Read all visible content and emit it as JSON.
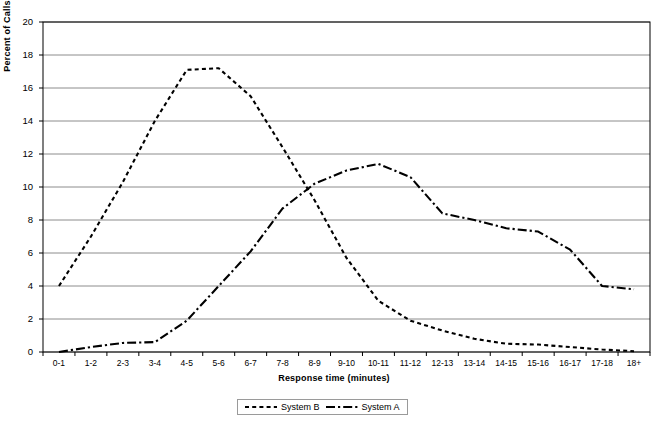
{
  "chart_data": {
    "type": "line",
    "title": "",
    "xlabel": "Response time (minutes)",
    "ylabel": "Percent of Calls",
    "ylim": [
      0,
      20
    ],
    "ytick_step": 2,
    "yticks": [
      "0",
      "2",
      "4",
      "6",
      "8",
      "10",
      "12",
      "14",
      "16",
      "18",
      "20"
    ],
    "grid": "horizontal",
    "legend_position": "bottom-center",
    "categories": [
      "0-1",
      "1-2",
      "2-3",
      "3-4",
      "4-5",
      "5-6",
      "6-7",
      "7-8",
      "8-9",
      "9-10",
      "10-11",
      "11-12",
      "12-13",
      "13-14",
      "14-15",
      "15-16",
      "16-17",
      "17-18",
      "18+"
    ],
    "series": [
      {
        "name": "System B",
        "style": "dashed",
        "color": "#000000",
        "values": [
          4.0,
          7.0,
          10.3,
          14.0,
          17.1,
          17.2,
          15.5,
          12.4,
          9.2,
          5.7,
          3.1,
          1.9,
          1.3,
          0.8,
          0.5,
          0.45,
          0.3,
          0.15,
          0.05
        ]
      },
      {
        "name": "System A",
        "style": "dash-dot",
        "color": "#000000",
        "values": [
          0.0,
          0.3,
          0.55,
          0.6,
          1.9,
          4.0,
          6.1,
          8.7,
          10.2,
          11.0,
          11.4,
          10.6,
          8.4,
          8.0,
          7.5,
          7.3,
          6.2,
          4.0,
          3.8
        ]
      }
    ],
    "series_a_values_by_category": {
      "0-1": 0.0,
      "1-2": 0.3,
      "2-3": 0.55,
      "3-4": 1.9,
      "4-5": 4.0,
      "5-6": 6.1,
      "6-7": 10.2,
      "7-8": 11.0,
      "8-9": 11.4,
      "9-10": 8.4,
      "10-11": 8.0,
      "11-12": 7.5,
      "12-13": 6.2,
      "13-14": 4.0,
      "14-15": 3.7,
      "15-16": 3.0,
      "16-17": 2.3,
      "17-18": 2.5,
      "18+": 6.7
    },
    "series_b_values_by_category": {
      "0-1": 4.0,
      "1-2": 7.0,
      "2-3": 10.3,
      "3-4": 17.1,
      "4-5": 17.2,
      "5-6": 15.4,
      "6-7": 12.4,
      "7-8": 9.2,
      "8-9": 5.7,
      "9-10": 3.1,
      "10-11": 1.9,
      "11-12": 1.3,
      "12-13": 0.8,
      "13-14": 0.5,
      "14-15": 0.45,
      "15-16": 0.3,
      "16-17": 0.15,
      "17-18": 0.1,
      "18+": 0.05
    }
  },
  "legend": {
    "entries": [
      {
        "label": "System B",
        "style": "dashed"
      },
      {
        "label": "System A",
        "style": "dash-dot"
      }
    ]
  },
  "axes": {
    "x_title": "Response time (minutes)",
    "y_title": "Percent of Calls"
  }
}
